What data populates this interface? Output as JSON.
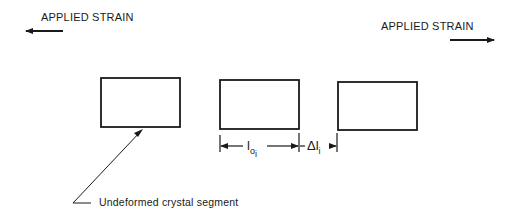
{
  "labels": {
    "strain_left": "APPLIED STRAIN",
    "strain_right": "APPLIED STRAIN",
    "callout": "Undeformed crystal segment"
  },
  "dimensions": {
    "length": {
      "base": "l",
      "sub1": "o",
      "sub2": "i"
    },
    "delta": {
      "base": "Δl",
      "sub": "i"
    }
  },
  "segments": [
    {
      "name": "segment-1",
      "x": 101,
      "y": 78,
      "w": 79,
      "h": 49
    },
    {
      "name": "segment-2",
      "x": 220,
      "y": 80,
      "w": 79,
      "h": 49
    },
    {
      "name": "segment-3",
      "x": 338,
      "y": 82,
      "w": 79,
      "h": 48
    }
  ],
  "colors": {
    "stroke": "#1a1a1a",
    "background": "#ffffff"
  }
}
